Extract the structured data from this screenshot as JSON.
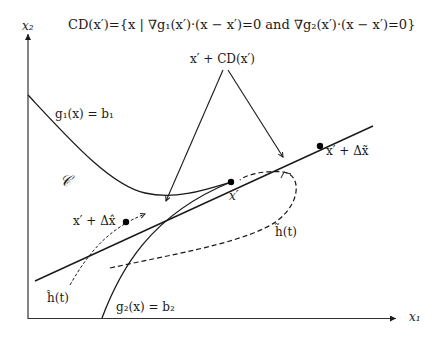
{
  "title": "CD(x′)={x | ∇g₁(x′)·(x − x′)=0 and ∇g₂(x′)·(x − x′)=0}",
  "axes": {
    "x_label": "x₁",
    "y_label": "x₂"
  },
  "labels": {
    "cd_label": "x′ + CD(x′)",
    "g1": "g₁(x) = b₁",
    "g2": "g₂(x) = b₂",
    "region": "𝒞",
    "x_prime": "x′",
    "x_tilde": "x′ + Δx̃",
    "x_hat": "x′ + Δx̂",
    "h_tilde": "h̃(t)",
    "h_hat": "ĥ(t)"
  },
  "colors": {
    "ink": "#1a1a1a",
    "background": "#ffffff"
  }
}
